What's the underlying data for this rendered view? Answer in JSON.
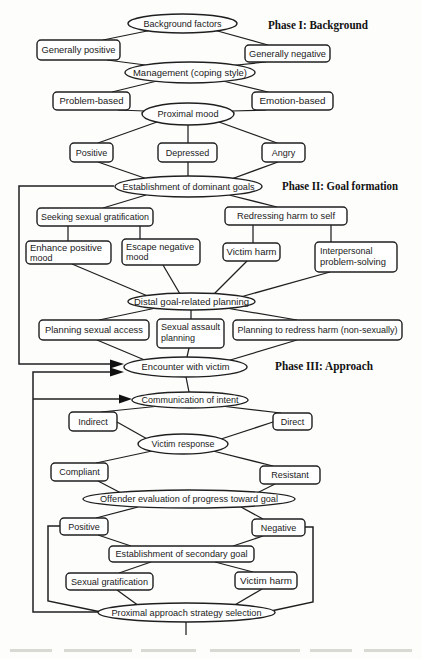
{
  "phases": {
    "phase1": "Phase I: Background",
    "phase2": "Phase II: Goal formation",
    "phase3": "Phase III: Approach"
  },
  "nodes": {
    "background_factors": "Background factors",
    "generally_positive": "Generally positive",
    "generally_negative": "Generally negative",
    "management": "Management (coping style)",
    "problem_based": "Problem-based",
    "emotion_based": "Emotion-based",
    "proximal_mood": "Proximal mood",
    "positive_mood": "Positive",
    "depressed_mood": "Depressed",
    "angry_mood": "Angry",
    "dominant_goals": "Establishment of dominant goals",
    "seeking_sexual_gratification": "Seeking sexual gratification",
    "redressing_harm_to_self": "Redressing harm to self",
    "enhance_positive_mood": {
      "line1": "Enhance positive",
      "line2": "mood"
    },
    "escape_negative_mood": {
      "line1": "Escape negative",
      "line2": "mood"
    },
    "victim_harm_goal": "Victim harm",
    "interpersonal_problem_solving": {
      "line1": "Interpersonal",
      "line2": "problem-solving"
    },
    "distal_planning": "Distal goal-related planning",
    "planning_sexual_access": "Planning sexual access",
    "sexual_assault_planning": {
      "line1": "Sexual assault",
      "line2": "planning"
    },
    "planning_redress_harm": "Planning to redress harm (non-sexually)",
    "encounter_with_victim": "Encounter with victim",
    "communication_of_intent": "Communication of intent",
    "indirect": "Indirect",
    "direct": "Direct",
    "victim_response": "Victim response",
    "compliant": "Compliant",
    "resistant": "Resistant",
    "offender_evaluation": "Offender evaluation of progress toward goal",
    "positive_evaluation": "Positive",
    "negative_evaluation": "Negative",
    "secondary_goal": "Establishment of secondary goal",
    "sexual_gratification": "Sexual gratification",
    "victim_harm_secondary": "Victim harm",
    "proximal_approach": "Proximal approach strategy selection"
  }
}
